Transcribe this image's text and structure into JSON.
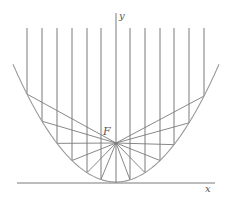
{
  "diagram": {
    "labels": {
      "y_axis": "y",
      "x_axis": "x",
      "focus": "F"
    },
    "geometry": {
      "vertex": [
        116,
        182
      ],
      "focus": [
        116,
        143
      ],
      "k": 0.0111,
      "parabola_x_range": [
        13,
        219
      ],
      "ray_top_y": 28,
      "ray_x": [
        27,
        42,
        57,
        72,
        87,
        101,
        130,
        145,
        160,
        174,
        189,
        204
      ],
      "y_axis": {
        "x": 116,
        "y_top": 13,
        "y_bottom": 183
      },
      "x_axis": {
        "y": 183,
        "x_left": 17,
        "x_right": 215
      }
    },
    "colors": {
      "stroke": "#7a7a7a",
      "parabola": "#9a9a9a",
      "text": "#555555"
    }
  }
}
